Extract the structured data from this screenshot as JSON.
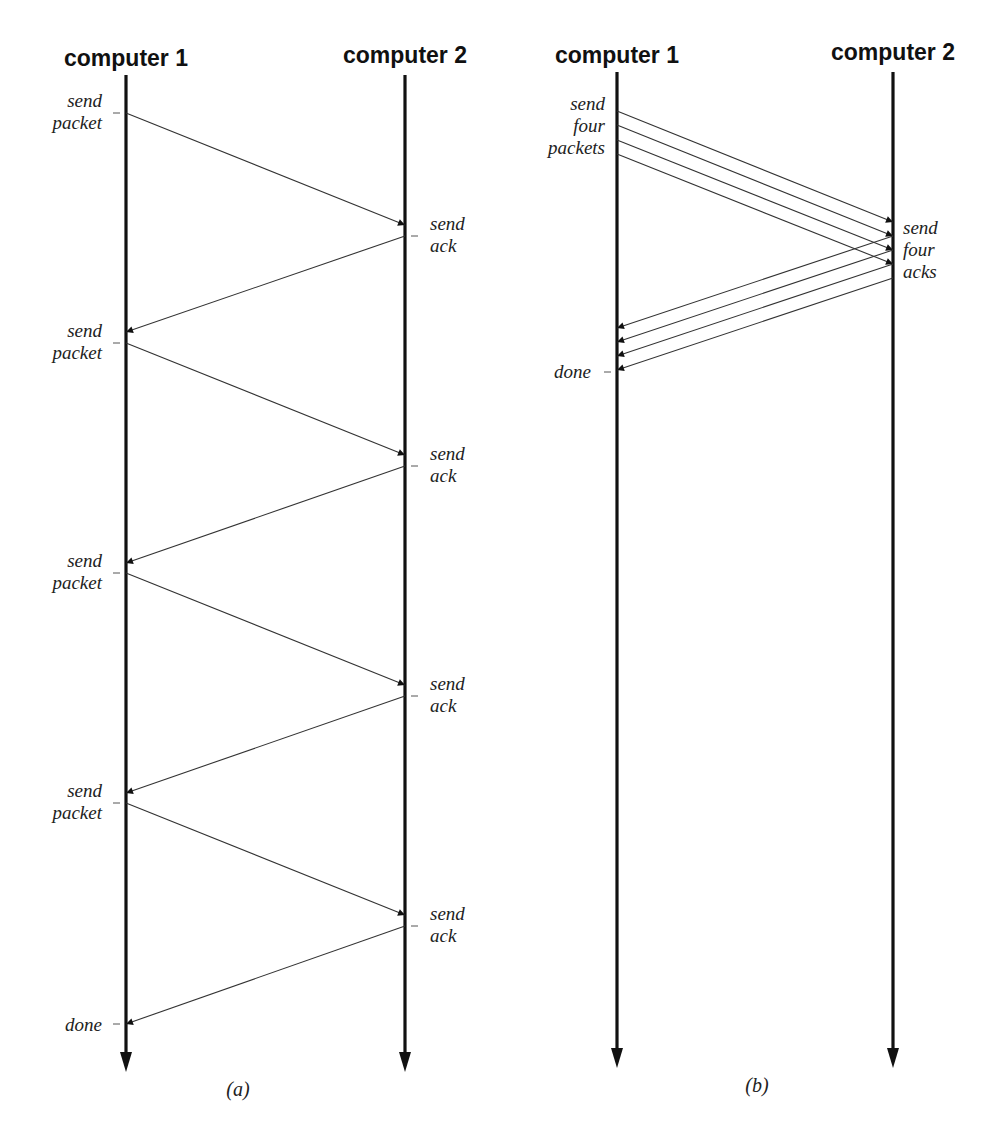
{
  "diagrams": [
    {
      "id": "a",
      "caption": "(a)",
      "lanes": [
        {
          "title": "computer 1",
          "x": 126
        },
        {
          "title": "computer 2",
          "x": 405
        }
      ],
      "axis": {
        "top": 75,
        "bottom": 1072
      },
      "messages": [
        {
          "kind": "packet",
          "from": [
            126,
            113
          ],
          "to": [
            405,
            225
          ]
        },
        {
          "kind": "ack",
          "from": [
            405,
            236
          ],
          "to": [
            126,
            332
          ]
        },
        {
          "kind": "packet",
          "from": [
            126,
            343
          ],
          "to": [
            405,
            455
          ]
        },
        {
          "kind": "ack",
          "from": [
            405,
            466
          ],
          "to": [
            126,
            563
          ]
        },
        {
          "kind": "packet",
          "from": [
            126,
            573
          ],
          "to": [
            405,
            685
          ]
        },
        {
          "kind": "ack",
          "from": [
            405,
            696
          ],
          "to": [
            126,
            793
          ]
        },
        {
          "kind": "packet",
          "from": [
            126,
            803
          ],
          "to": [
            405,
            915
          ]
        },
        {
          "kind": "ack",
          "from": [
            405,
            926
          ],
          "to": [
            126,
            1024
          ]
        }
      ],
      "labels": [
        {
          "lines": [
            "send",
            "packet"
          ],
          "side": "left",
          "x": 102,
          "y": 107,
          "tick_y": 113
        },
        {
          "lines": [
            "send",
            "ack"
          ],
          "side": "right",
          "x": 430,
          "y": 230,
          "tick_y": 236
        },
        {
          "lines": [
            "send",
            "packet"
          ],
          "side": "left",
          "x": 102,
          "y": 337,
          "tick_y": 343
        },
        {
          "lines": [
            "send",
            "ack"
          ],
          "side": "right",
          "x": 430,
          "y": 460,
          "tick_y": 466
        },
        {
          "lines": [
            "send",
            "packet"
          ],
          "side": "left",
          "x": 102,
          "y": 567,
          "tick_y": 573
        },
        {
          "lines": [
            "send",
            "ack"
          ],
          "side": "right",
          "x": 430,
          "y": 690,
          "tick_y": 696
        },
        {
          "lines": [
            "send",
            "packet"
          ],
          "side": "left",
          "x": 102,
          "y": 797,
          "tick_y": 803
        },
        {
          "lines": [
            "send",
            "ack"
          ],
          "side": "right",
          "x": 430,
          "y": 920,
          "tick_y": 926
        },
        {
          "lines": [
            "done"
          ],
          "side": "left",
          "x": 102,
          "y": 1031,
          "tick_y": 1024
        }
      ]
    },
    {
      "id": "b",
      "caption": "(b)",
      "lanes": [
        {
          "title": "computer 1",
          "x": 617
        },
        {
          "title": "computer 2",
          "x": 893
        }
      ],
      "axis": {
        "top": 72,
        "bottom": 1068
      },
      "messages": [
        {
          "kind": "packet",
          "from": [
            617,
            111
          ],
          "to": [
            893,
            222
          ]
        },
        {
          "kind": "packet",
          "from": [
            617,
            125
          ],
          "to": [
            893,
            236
          ]
        },
        {
          "kind": "packet",
          "from": [
            617,
            140
          ],
          "to": [
            893,
            250
          ]
        },
        {
          "kind": "packet",
          "from": [
            617,
            154
          ],
          "to": [
            893,
            264
          ]
        },
        {
          "kind": "ack",
          "from": [
            893,
            236
          ],
          "to": [
            617,
            328
          ]
        },
        {
          "kind": "ack",
          "from": [
            893,
            250
          ],
          "to": [
            617,
            342
          ]
        },
        {
          "kind": "ack",
          "from": [
            893,
            264
          ],
          "to": [
            617,
            356
          ]
        },
        {
          "kind": "ack",
          "from": [
            893,
            278
          ],
          "to": [
            617,
            370
          ]
        }
      ],
      "labels": [
        {
          "lines": [
            "send",
            "four",
            "packets"
          ],
          "side": "left",
          "x": 605,
          "y": 110,
          "tick_y": null
        },
        {
          "lines": [
            "send",
            "four",
            "acks"
          ],
          "side": "right",
          "x": 903,
          "y": 234,
          "tick_y": null
        },
        {
          "lines": [
            "done"
          ],
          "side": "left",
          "x": 591,
          "y": 378,
          "tick_y": 372
        }
      ]
    }
  ],
  "text": {
    "a_title_1": "computer 1",
    "a_title_2": "computer 2",
    "b_title_1": "computer 1",
    "b_title_2": "computer 2",
    "a_caption": "(a)",
    "b_caption": "(b)",
    "a_labels": [
      [
        "send",
        "packet"
      ],
      [
        "send",
        "ack"
      ],
      [
        "send",
        "packet"
      ],
      [
        "send",
        "ack"
      ],
      [
        "send",
        "packet"
      ],
      [
        "send",
        "ack"
      ],
      [
        "send",
        "packet"
      ],
      [
        "send",
        "ack"
      ],
      [
        "done"
      ]
    ],
    "b_labels": [
      [
        "send",
        "four",
        "packets"
      ],
      [
        "send",
        "four",
        "acks"
      ],
      [
        "done"
      ]
    ]
  },
  "colors": {
    "axis": "#111111",
    "message": "#333333",
    "text": "#222222",
    "background": "#ffffff"
  }
}
